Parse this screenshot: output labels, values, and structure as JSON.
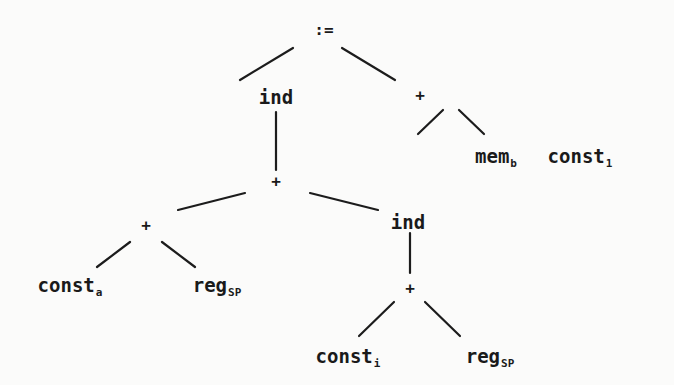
{
  "diagram": {
    "type": "expression-tree",
    "nodes": [
      {
        "id": "assign",
        "label": ":=",
        "sub": "",
        "x": 324,
        "y": 30,
        "op": true
      },
      {
        "id": "ind-left",
        "label": "ind",
        "sub": "",
        "x": 276,
        "y": 97,
        "op": false
      },
      {
        "id": "plus-right",
        "label": "+",
        "sub": "",
        "x": 420,
        "y": 96,
        "op": true
      },
      {
        "id": "mem-b",
        "label": "mem",
        "sub": "b",
        "x": 496,
        "y": 158,
        "op": false
      },
      {
        "id": "const-1",
        "label": "const",
        "sub": "1",
        "x": 580,
        "y": 158,
        "op": false
      },
      {
        "id": "plus-mid",
        "label": "+",
        "sub": "",
        "x": 276,
        "y": 182,
        "op": true
      },
      {
        "id": "plus-low-left",
        "label": "+",
        "sub": "",
        "x": 146,
        "y": 226,
        "op": true
      },
      {
        "id": "ind-right",
        "label": "ind",
        "sub": "",
        "x": 408,
        "y": 222,
        "op": false
      },
      {
        "id": "const-a",
        "label": "const",
        "sub": "a",
        "x": 70,
        "y": 287,
        "op": false
      },
      {
        "id": "reg-sp-left",
        "label": "reg",
        "sub": "SP",
        "x": 217,
        "y": 287,
        "op": false
      },
      {
        "id": "plus-bottom",
        "label": "+",
        "sub": "",
        "x": 410,
        "y": 289,
        "op": true
      },
      {
        "id": "const-i",
        "label": "const",
        "sub": "i",
        "x": 348,
        "y": 358,
        "op": false
      },
      {
        "id": "reg-sp-right",
        "label": "reg",
        "sub": "SP",
        "x": 490,
        "y": 358,
        "op": false
      }
    ],
    "edges": [
      {
        "from": "assign",
        "to": "ind-left",
        "x1": 293,
        "y1": 48,
        "x2": 240,
        "y2": 80
      },
      {
        "from": "assign",
        "to": "plus-right",
        "x1": 342,
        "y1": 48,
        "x2": 395,
        "y2": 80
      },
      {
        "from": "plus-right",
        "to": "mem-b",
        "x1": 443,
        "y1": 110,
        "x2": 418,
        "y2": 134
      },
      {
        "from": "plus-right",
        "to": "const-1",
        "x1": 459,
        "y1": 110,
        "x2": 484,
        "y2": 134
      },
      {
        "from": "ind-left",
        "to": "plus-mid",
        "x1": 276,
        "y1": 112,
        "x2": 276,
        "y2": 170
      },
      {
        "from": "plus-mid",
        "to": "plus-low-left",
        "x1": 245,
        "y1": 193,
        "x2": 178,
        "y2": 210
      },
      {
        "from": "plus-mid",
        "to": "ind-right",
        "x1": 310,
        "y1": 193,
        "x2": 378,
        "y2": 210
      },
      {
        "from": "plus-low-left",
        "to": "const-a",
        "x1": 130,
        "y1": 242,
        "x2": 97,
        "y2": 267
      },
      {
        "from": "plus-low-left",
        "to": "reg-sp-left",
        "x1": 162,
        "y1": 242,
        "x2": 195,
        "y2": 267
      },
      {
        "from": "ind-right",
        "to": "plus-bottom",
        "x1": 410,
        "y1": 233,
        "x2": 410,
        "y2": 273
      },
      {
        "from": "plus-bottom",
        "to": "const-i",
        "x1": 394,
        "y1": 302,
        "x2": 359,
        "y2": 336
      },
      {
        "from": "plus-bottom",
        "to": "reg-sp-right",
        "x1": 425,
        "y1": 302,
        "x2": 460,
        "y2": 336
      }
    ]
  }
}
